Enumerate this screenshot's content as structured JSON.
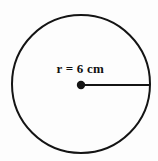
{
  "diagram": {
    "type": "circle-radius-diagram",
    "background_color": "#fdfdfd",
    "stroke_color": "#141414",
    "label_color": "#111111",
    "circle": {
      "name": "circle-outline",
      "center_x": 81,
      "center_y": 84,
      "radius_px": 69,
      "stroke_width": 2,
      "fill": "none"
    },
    "center_point": {
      "name": "center-dot",
      "x": 81,
      "y": 85,
      "radius_px": 4.2,
      "fill": "#141414"
    },
    "radius_segment": {
      "name": "radius-line",
      "x1": 81,
      "y1": 85,
      "x2": 150,
      "y2": 85,
      "stroke_width": 2
    },
    "radius_label": {
      "name": "radius-label",
      "text": "r = 6 cm",
      "value": 6,
      "unit": "cm",
      "symbol": "r"
    }
  }
}
